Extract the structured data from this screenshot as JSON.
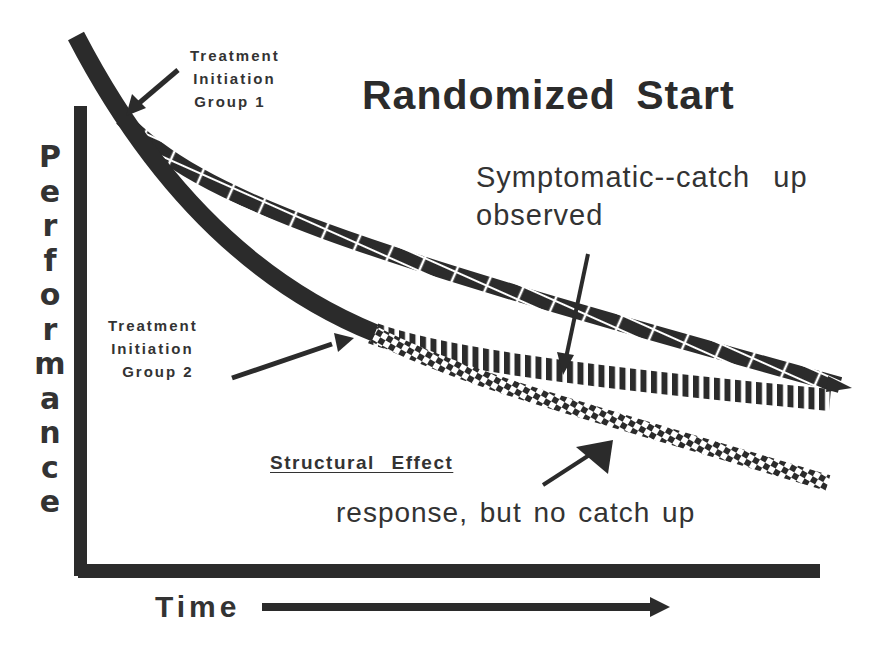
{
  "title": "Randomized Start",
  "axes": {
    "y_label": "Performance",
    "y_letters": [
      "P",
      "e",
      "r",
      "f",
      "o",
      "r",
      "m",
      "a",
      "n",
      "c",
      "e"
    ],
    "x_label": "Time"
  },
  "annotations": {
    "group1": [
      "Treatment",
      "Initiation",
      "Group 1"
    ],
    "group2": [
      "Treatment",
      "Initiation",
      "Group 2"
    ],
    "symptomatic": [
      "Symptomatic--catch up",
      "observed"
    ],
    "structural_heading": "Structural Effect",
    "structural_note": "response, but no catch up"
  },
  "curves": [
    {
      "name": "untreated-decline",
      "style": "solid",
      "description": "Natural decline before treatment"
    },
    {
      "name": "group1-treated",
      "style": "cross-hatched",
      "description": "Group 1 trajectory after early treatment initiation"
    },
    {
      "name": "symptomatic-group2",
      "style": "vertical-striped",
      "description": "Group 2 symptomatic effect, catches up"
    },
    {
      "name": "structural-group2",
      "style": "checkered",
      "description": "Group 2 structural effect, no catch up"
    }
  ],
  "colors": {
    "ink": "#2b2b2b",
    "background": "#ffffff"
  }
}
